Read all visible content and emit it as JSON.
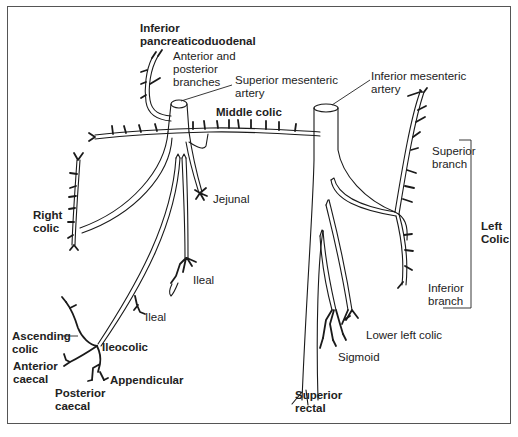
{
  "figure": {
    "left_panel": {
      "name": "Superior mesenteric artery and branches",
      "labels": {
        "inferior_pancreaticoduodenal": [
          "Inferior",
          "pancreaticoduodenal"
        ],
        "anterior_posterior_branches": [
          "Anterior and",
          "posterior",
          "branches"
        ],
        "superior_mesenteric_artery": [
          "Superior mesenteric",
          "artery"
        ],
        "middle_colic": "Middle colic",
        "jejunal": "Jejunal",
        "right_colic": [
          "Right",
          "colic"
        ],
        "ileal_upper": "Ileal",
        "ileal_lower": "Ileal",
        "ascending_colic": [
          "Ascending",
          "colic"
        ],
        "ileocolic": "Ileocolic",
        "anterior_caecal": [
          "Anterior",
          "caecal"
        ],
        "appendicular": "Appendicular",
        "posterior_caecal": [
          "Posterior",
          "caecal"
        ]
      }
    },
    "right_panel": {
      "name": "Inferior mesenteric artery and branches",
      "labels": {
        "inferior_mesenteric_artery": [
          "Inferior mesenteric",
          "artery"
        ],
        "superior_branch": [
          "Superior",
          "branch"
        ],
        "left_colic": [
          "Left",
          "Colic"
        ],
        "inferior_branch": [
          "Inferior",
          "branch"
        ],
        "lower_left_colic": "Lower left colic",
        "sigmoid": "Sigmoid",
        "superior_rectal": [
          "Superior",
          "rectal"
        ]
      }
    }
  }
}
